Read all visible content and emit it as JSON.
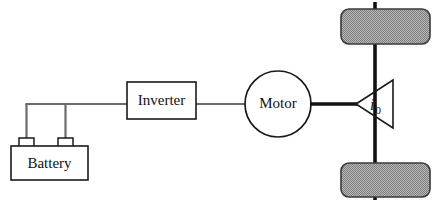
{
  "diagram": {
    "canvas": {
      "width": 439,
      "height": 204,
      "background": "#ffffff"
    },
    "colors": {
      "stroke_dark": "#1a1a1a",
      "wire_electrical": "#6b6b6b",
      "shaft_mechanical": "#111111",
      "wheel_fill": "#9a9a9a",
      "wheel_stroke": "#3a3a3a",
      "text": "#111111",
      "background": "#ffffff"
    },
    "blocks": [
      {
        "id": "battery",
        "label": "Battery",
        "shape": "rectangle-with-terminals",
        "x": 11,
        "y": 146,
        "width": 77,
        "height": 34,
        "terminals": [
          {
            "x": 19,
            "y": 138,
            "width": 15,
            "height": 9
          },
          {
            "x": 58,
            "y": 138,
            "width": 15,
            "height": 9
          }
        ]
      },
      {
        "id": "inverter",
        "label": "Inverter",
        "shape": "rectangle",
        "x": 127,
        "y": 82,
        "width": 69,
        "height": 37
      },
      {
        "id": "motor",
        "label": "Motor",
        "shape": "circle",
        "cx": 278,
        "cy": 104,
        "r": 33
      },
      {
        "id": "gearbox",
        "label_base": "i",
        "label_subscript": "0",
        "shape": "triangle-left-apex",
        "apex_x": 356,
        "apex_y": 104,
        "right_x": 393,
        "top_y": 80,
        "bottom_y": 128
      }
    ],
    "wheels": [
      {
        "id": "wheel-front",
        "position": "top",
        "x": 341,
        "y": 9,
        "width": 89,
        "height": 35,
        "rx": 8
      },
      {
        "id": "wheel-rear",
        "position": "bottom",
        "x": 341,
        "y": 163,
        "width": 89,
        "height": 34,
        "rx": 8
      }
    ],
    "connections": [
      {
        "id": "battery-terminal-left-riser",
        "type": "electrical",
        "from": "battery",
        "to": "bus"
      },
      {
        "id": "battery-terminal-right-riser",
        "type": "electrical",
        "from": "battery",
        "to": "bus"
      },
      {
        "id": "dc-bus-to-inverter",
        "type": "electrical",
        "from": "battery",
        "to": "inverter"
      },
      {
        "id": "inverter-to-motor",
        "type": "electrical",
        "from": "inverter",
        "to": "motor"
      },
      {
        "id": "motor-to-gearbox-shaft",
        "type": "mechanical",
        "from": "motor",
        "to": "gearbox"
      },
      {
        "id": "axle-upper",
        "type": "mechanical",
        "from": "gearbox",
        "to": "wheel-front"
      },
      {
        "id": "axle-lower",
        "type": "mechanical",
        "from": "gearbox",
        "to": "wheel-rear"
      }
    ]
  }
}
